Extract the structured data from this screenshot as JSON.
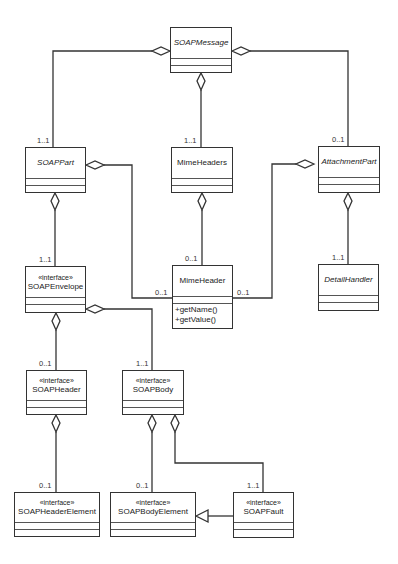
{
  "diagram": {
    "type": "UML class diagram",
    "classes": [
      {
        "id": "soap_message",
        "name": "SOAPMessage",
        "stereotype": "",
        "abstract": true,
        "operations": []
      },
      {
        "id": "soap_part",
        "name": "SOAPPart",
        "stereotype": "",
        "abstract": true,
        "operations": []
      },
      {
        "id": "mime_headers",
        "name": "MimeHeaders",
        "stereotype": "",
        "abstract": false,
        "operations": []
      },
      {
        "id": "attachment_part",
        "name": "AttachmentPart",
        "stereotype": "",
        "abstract": true,
        "operations": []
      },
      {
        "id": "soap_envelope",
        "name": "SOAPEnvelope",
        "stereotype": "«interface»",
        "abstract": false,
        "operations": []
      },
      {
        "id": "mime_header",
        "name": "MimeHeader",
        "stereotype": "",
        "abstract": false,
        "operations": [
          "+getName()",
          "+getValue()"
        ]
      },
      {
        "id": "detail_handler",
        "name": "DetailHandler",
        "stereotype": "",
        "abstract": true,
        "operations": []
      },
      {
        "id": "soap_header",
        "name": "SOAPHeader",
        "stereotype": "«interface»",
        "abstract": false,
        "operations": []
      },
      {
        "id": "soap_body",
        "name": "SOAPBody",
        "stereotype": "«interface»",
        "abstract": false,
        "operations": []
      },
      {
        "id": "soap_header_element",
        "name": "SOAPHeaderElement",
        "stereotype": "«interface»",
        "abstract": false,
        "operations": []
      },
      {
        "id": "soap_body_element",
        "name": "SOAPBodyElement",
        "stereotype": "«interface»",
        "abstract": false,
        "operations": []
      },
      {
        "id": "soap_fault",
        "name": "SOAPFault",
        "stereotype": "«interface»",
        "abstract": false,
        "operations": []
      }
    ],
    "relationships": [
      {
        "type": "aggregation",
        "whole": "SOAPMessage",
        "part": "SOAPPart",
        "multiplicity": "1..1"
      },
      {
        "type": "aggregation",
        "whole": "SOAPMessage",
        "part": "MimeHeaders",
        "multiplicity": "1..1"
      },
      {
        "type": "aggregation",
        "whole": "SOAPMessage",
        "part": "AttachmentPart",
        "multiplicity": "0..1"
      },
      {
        "type": "aggregation",
        "whole": "SOAPPart",
        "part": "SOAPEnvelope",
        "multiplicity": "1..1"
      },
      {
        "type": "aggregation",
        "whole": "SOAPPart",
        "part": "MimeHeader",
        "multiplicity": "0..1"
      },
      {
        "type": "aggregation",
        "whole": "MimeHeaders",
        "part": "MimeHeader",
        "multiplicity": "0..1"
      },
      {
        "type": "aggregation",
        "whole": "AttachmentPart",
        "part": "MimeHeader",
        "multiplicity": "0..1"
      },
      {
        "type": "aggregation",
        "whole": "AttachmentPart",
        "part": "DetailHandler",
        "multiplicity": "1..1"
      },
      {
        "type": "aggregation",
        "whole": "SOAPEnvelope",
        "part": "SOAPHeader",
        "multiplicity": "0..1"
      },
      {
        "type": "aggregation",
        "whole": "SOAPEnvelope",
        "part": "SOAPBody",
        "multiplicity": "1..1"
      },
      {
        "type": "aggregation",
        "whole": "SOAPHeader",
        "part": "SOAPHeaderElement",
        "multiplicity": "0..1"
      },
      {
        "type": "aggregation",
        "whole": "SOAPBody",
        "part": "SOAPBodyElement",
        "multiplicity": "0..1"
      },
      {
        "type": "aggregation",
        "whole": "SOAPBody",
        "part": "SOAPFault",
        "multiplicity": "1..1"
      },
      {
        "type": "generalization",
        "child": "SOAPFault",
        "parent": "SOAPBodyElement"
      }
    ],
    "multiplicity_labels": {
      "soap_part_top": "1..1",
      "mime_headers_top": "1..1",
      "attachment_part_top": "0..1",
      "soap_envelope_top": "1..1",
      "mime_header_top": "0..1",
      "mime_header_left": "0..1",
      "mime_header_right": "0..1",
      "detail_handler_top": "1..1",
      "soap_header_top": "0..1",
      "soap_body_top": "1..1",
      "soap_header_element_top": "0..1",
      "soap_body_element_top": "0..1",
      "soap_fault_top": "1..1"
    },
    "colors": {
      "line": "#333333",
      "background": "#ffffff",
      "text": "#222222"
    }
  }
}
